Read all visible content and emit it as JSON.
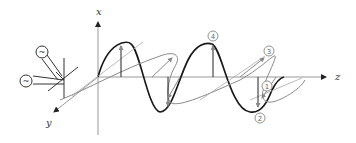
{
  "diagram": {
    "title": "",
    "axes": {
      "x_label": "x",
      "y_label": "y",
      "z_label": "z"
    },
    "markers": [
      {
        "id": "1",
        "label": "①"
      },
      {
        "id": "2",
        "label": "②"
      },
      {
        "id": "3",
        "label": "③"
      },
      {
        "id": "4",
        "label": "④"
      }
    ],
    "source": {
      "description": "Two AC sources feeding crossed dipole antennas",
      "symbol_1": "~",
      "symbol_2": "~"
    },
    "colors": {
      "primary_wave": "#1a1a1a",
      "secondary_wave": "#8a8a8a",
      "axis": "#999999",
      "arrow": "#333333"
    }
  }
}
